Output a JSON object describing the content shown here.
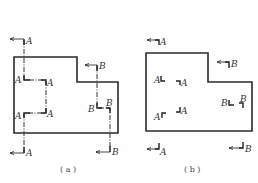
{
  "figure": {
    "panels": [
      {
        "id": "a",
        "caption": "( a )",
        "labels": {
          "a_top": "A",
          "a_mid_left1": "A",
          "a_mid_right1": "A",
          "a_mid_left2": "A",
          "a_mid_right2": "A",
          "a_bottom": "A",
          "b_top": "B",
          "b_mid_left": "B",
          "b_mid_right": "B",
          "b_bottom": "B"
        }
      },
      {
        "id": "b",
        "caption": "( b )",
        "labels": {
          "a_top": "A",
          "a_mid_left1": "A",
          "a_mid_right1": "A",
          "a_mid_left2": "A",
          "a_mid_right2": "A",
          "a_bottom": "A",
          "b_top": "B",
          "b_mid_left": "B",
          "b_mid_right": "B",
          "b_bottom": "B"
        }
      }
    ],
    "colors": {
      "line": "#2a2a2a",
      "background": "#ffffff"
    }
  }
}
